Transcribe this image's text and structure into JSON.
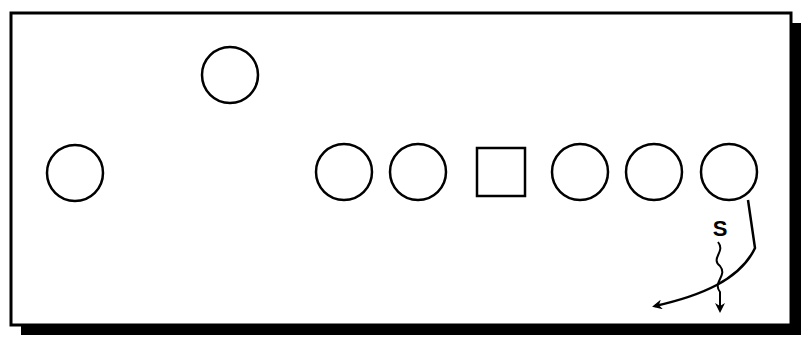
{
  "diagram": {
    "type": "football-play",
    "frame": {
      "x": 11,
      "y": 13,
      "width": 780,
      "height": 312,
      "shadow_offset": 10,
      "stroke": "#000000",
      "fill": "#ffffff"
    },
    "players": [
      {
        "id": "wide-left",
        "shape": "circle",
        "cx": 75,
        "cy": 173,
        "r": 28
      },
      {
        "id": "backfield-top",
        "shape": "circle",
        "cx": 230,
        "cy": 75,
        "r": 28
      },
      {
        "id": "line-1",
        "shape": "circle",
        "cx": 344,
        "cy": 172,
        "r": 28
      },
      {
        "id": "line-2",
        "shape": "circle",
        "cx": 418,
        "cy": 172,
        "r": 28
      },
      {
        "id": "center",
        "shape": "square",
        "x": 477,
        "y": 148,
        "size": 48
      },
      {
        "id": "line-3",
        "shape": "circle",
        "cx": 580,
        "cy": 172,
        "r": 28
      },
      {
        "id": "line-4",
        "shape": "circle",
        "cx": 654,
        "cy": 172,
        "r": 28
      },
      {
        "id": "end-right",
        "shape": "circle",
        "cx": 729,
        "cy": 172,
        "r": 28
      }
    ],
    "label": {
      "text": "S",
      "x": 720,
      "y": 236
    },
    "routes": [
      {
        "id": "end-route",
        "style": "solid",
        "path": "M748,200 L755,248 C740,280 700,296 655,306"
      },
      {
        "id": "s-motion",
        "style": "wavy",
        "path": "M718,242 C726,252 710,258 720,266 C728,276 712,282 720,292 L720,310"
      }
    ]
  }
}
